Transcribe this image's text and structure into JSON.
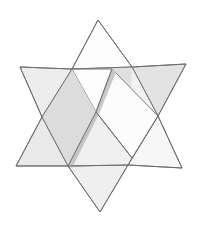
{
  "figure": {
    "name": "woven-hexagram",
    "title": "Interwoven Star of David",
    "canvas": {
      "width": 205,
      "height": 228,
      "background": "#ffffff"
    },
    "colors": {
      "background": "#ffffff",
      "outline": "#6e6e6e",
      "outline_soft": "#9a9a9a",
      "face_white": "#fdfdfd",
      "face_light": "#ececec",
      "face_mid": "#e2e2e2",
      "face_dark": "#d2d2d2",
      "face_shadow": "#c9c9c9"
    },
    "stroke_width": "1",
    "triangles": [
      {
        "name": "upward-triangle",
        "orientation": "point-up",
        "tone": "white",
        "vertices": [
          {
            "label": "top",
            "x": 98,
            "y": 20
          },
          {
            "label": "bottom-right",
            "x": 182,
            "y": 168
          },
          {
            "label": "bottom-left",
            "x": 16,
            "y": 166
          }
        ]
      },
      {
        "name": "downward-triangle",
        "orientation": "point-down",
        "tone": "gray",
        "vertices": [
          {
            "label": "bottom",
            "x": 100,
            "y": 212
          },
          {
            "label": "top-left",
            "x": 20,
            "y": 67
          },
          {
            "label": "top-right",
            "x": 186,
            "y": 64
          }
        ]
      }
    ],
    "hexagon_core": {
      "name": "central-hexagon",
      "vertices": [
        {
          "x": 72,
          "y": 69
        },
        {
          "x": 132,
          "y": 67
        },
        {
          "x": 158,
          "y": 116
        },
        {
          "x": 128,
          "y": 165
        },
        {
          "x": 68,
          "y": 166
        },
        {
          "x": 42,
          "y": 117
        }
      ]
    },
    "points": [
      {
        "name": "point-north",
        "tone": "white"
      },
      {
        "name": "point-northeast",
        "tone": "light"
      },
      {
        "name": "point-southeast",
        "tone": "white"
      },
      {
        "name": "point-south",
        "tone": "white"
      },
      {
        "name": "point-southwest",
        "tone": "dark"
      },
      {
        "name": "point-northwest",
        "tone": "light"
      }
    ],
    "weave_order": [
      "northwest-light-over",
      "north-white-over",
      "northeast-gray-over",
      "southeast-white-over",
      "south-gray-over",
      "southwest-gray-over"
    ]
  }
}
